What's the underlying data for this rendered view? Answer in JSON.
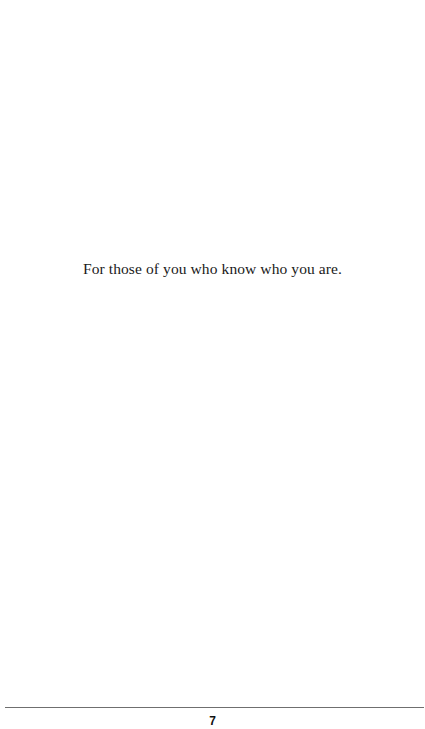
{
  "page": {
    "dedication": "For those of you who know who you are.",
    "page_number": "7"
  }
}
